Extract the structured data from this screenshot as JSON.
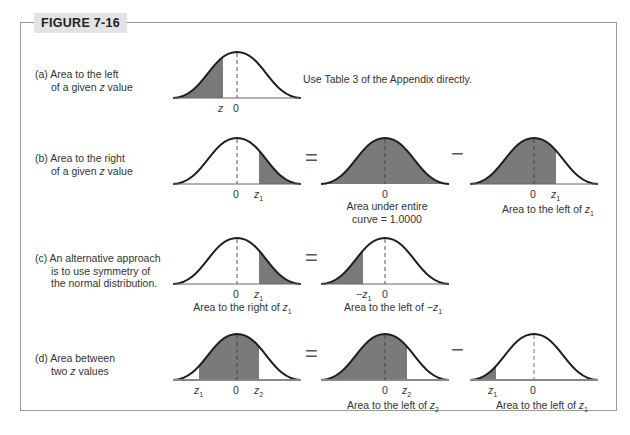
{
  "figure": {
    "label": "FIGURE 7-16"
  },
  "colors": {
    "shade": "#7a7a7a",
    "curve": "#1e1e1e",
    "frame": "#9a9a9a",
    "label_bg": "#e3e3e3"
  },
  "rows": [
    {
      "id": "a",
      "desc_line1": "(a) Area to the left",
      "desc_line2": "of a given z value",
      "note": "Use Table 3 of the Appendix directly.",
      "ticks": [
        "z",
        "0"
      ]
    },
    {
      "id": "b",
      "desc_line1": "(b) Area to the right",
      "desc_line2": "of a given z value",
      "ticks_left": [
        "0",
        "z1"
      ],
      "op1": "=",
      "mid_tick": "0",
      "mid_caption_1": "Area under entire",
      "mid_caption_2": "curve = 1.0000",
      "op2": "−",
      "right_ticks": [
        "0",
        "z1"
      ],
      "right_caption": "Area to the left of z1"
    },
    {
      "id": "c",
      "desc_line1": "(c) An alternative approach",
      "desc_line2": "is to use symmetry of",
      "desc_line3": "the normal distribution.",
      "ticks_left": [
        "0",
        "z1"
      ],
      "left_caption": "Area to the right of z1",
      "op1": "=",
      "mid_ticks": [
        "−z1",
        "0"
      ],
      "mid_caption": "Area to the left of −z1"
    },
    {
      "id": "d",
      "desc_line1": "(d) Area between",
      "desc_line2": "two z values",
      "ticks_left": [
        "z1",
        "0",
        "z2"
      ],
      "op1": "=",
      "mid_ticks": [
        "0",
        "z2"
      ],
      "mid_caption": "Area to the left of z2",
      "op2": "−",
      "right_ticks": [
        "z1",
        "0"
      ],
      "right_caption": "Area to the left of z1"
    }
  ]
}
